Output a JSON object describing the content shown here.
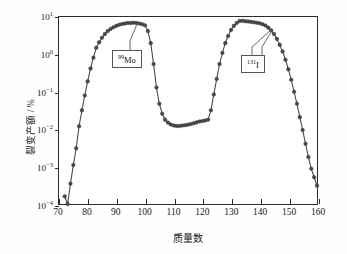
{
  "chart_data": {
    "type": "line",
    "title": "",
    "xlabel": "质量数",
    "ylabel": "裂变产额 / %",
    "yscale": "log",
    "xlim": [
      70,
      160
    ],
    "ylim": [
      0.0001,
      10
    ],
    "grid": false,
    "legend": "none",
    "xticks": [
      70,
      80,
      90,
      100,
      110,
      120,
      130,
      140,
      150,
      160
    ],
    "xtick_labels": [
      "70",
      "80",
      "90",
      "100",
      "110",
      "120",
      "130",
      "140",
      "150",
      "160"
    ],
    "yticks": [
      10,
      1,
      0.1,
      0.01,
      0.001,
      0.0001
    ],
    "ytick_labels": [
      "10¹",
      "10⁰",
      "10⁻¹",
      "10⁻²",
      "10⁻³",
      "10⁻⁴"
    ],
    "series": [
      {
        "name": "fission-yield",
        "marker": "filled-circle",
        "color": "#4a4a4a",
        "x": [
          72,
          73,
          74,
          75,
          76,
          77,
          78,
          79,
          80,
          81,
          82,
          83,
          84,
          85,
          86,
          87,
          88,
          89,
          90,
          91,
          92,
          93,
          94,
          95,
          96,
          97,
          98,
          99,
          100,
          101,
          102,
          103,
          104,
          105,
          106,
          107,
          108,
          109,
          110,
          111,
          112,
          113,
          114,
          115,
          116,
          117,
          118,
          119,
          120,
          121,
          122,
          123,
          124,
          125,
          126,
          127,
          128,
          129,
          130,
          131,
          132,
          133,
          134,
          135,
          136,
          137,
          138,
          139,
          140,
          141,
          142,
          143,
          144,
          145,
          146,
          147,
          148,
          149,
          150,
          151,
          152,
          153,
          154,
          155,
          156,
          157,
          158,
          159,
          160
        ],
        "y": [
          0.00016,
          0.0001,
          0.00035,
          0.0011,
          0.0031,
          0.012,
          0.032,
          0.08,
          0.19,
          0.42,
          0.82,
          1.5,
          2.1,
          2.8,
          3.5,
          4.2,
          4.8,
          5.3,
          5.8,
          6.2,
          6.5,
          6.7,
          6.9,
          6.95,
          7.0,
          6.9,
          6.7,
          6.4,
          6.0,
          4.2,
          2.0,
          0.55,
          0.13,
          0.048,
          0.026,
          0.018,
          0.015,
          0.0133,
          0.0126,
          0.0122,
          0.0122,
          0.0125,
          0.0128,
          0.0132,
          0.0138,
          0.0145,
          0.0152,
          0.016,
          0.0165,
          0.017,
          0.018,
          0.032,
          0.085,
          0.22,
          0.55,
          1.1,
          2.0,
          3.1,
          4.5,
          5.8,
          6.9,
          7.8,
          7.9,
          7.7,
          7.6,
          7.4,
          7.2,
          7.0,
          6.8,
          6.4,
          5.9,
          5.2,
          4.4,
          3.5,
          2.6,
          1.8,
          1.2,
          0.72,
          0.4,
          0.21,
          0.1,
          0.048,
          0.021,
          0.0095,
          0.0041,
          0.0018,
          0.00088,
          0.00052,
          0.00031
        ]
      }
    ],
    "annotations": [
      {
        "id": "mo99",
        "label_mass": "99",
        "label_symbol": "Mo",
        "points_to_x": 97,
        "points_to_y": 7.0
      },
      {
        "id": "i131",
        "label_mass": "131",
        "label_symbol": "I",
        "points_to_x": 133,
        "points_to_y": 7.8
      }
    ]
  },
  "axes": {
    "y_title": "裂变产额 / %",
    "x_title": "质量数"
  }
}
